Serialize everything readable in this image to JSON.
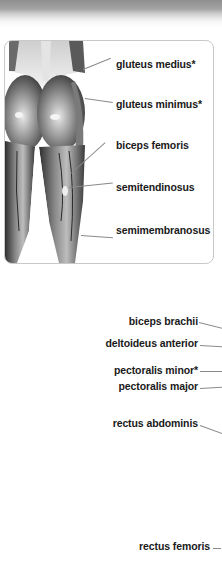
{
  "posterior_panel": {
    "labels": [
      {
        "text": "gluteus medius*"
      },
      {
        "text": "gluteus minimus*"
      },
      {
        "text": "biceps femoris"
      },
      {
        "text": "semitendinosus"
      },
      {
        "text": "semimembranosus"
      }
    ]
  },
  "anterior_panel": {
    "labels": [
      {
        "text": "biceps brachii"
      },
      {
        "text": "deltoideus anterior"
      },
      {
        "text": "pectoralis minor*"
      },
      {
        "text": "pectoralis major"
      },
      {
        "text": "rectus abdominis"
      },
      {
        "text": "rectus femoris"
      }
    ]
  },
  "colors": {
    "label_text": "#1a1a1a",
    "leader_line": "#8a8a8a",
    "card_border": "#c9c9c9",
    "header_bar": "#8f8f8f"
  }
}
